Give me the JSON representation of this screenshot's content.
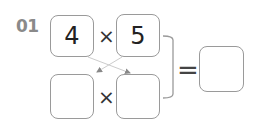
{
  "problem": {
    "number": "01",
    "top_row": {
      "left": "4",
      "operator": "×",
      "right": "5"
    },
    "bottom_row": {
      "left": "",
      "operator": "×",
      "right": ""
    },
    "equals": "=",
    "result": ""
  },
  "colors": {
    "border": "#9a9a9a",
    "number": "#8a8a8a",
    "arrow": "#888888"
  }
}
